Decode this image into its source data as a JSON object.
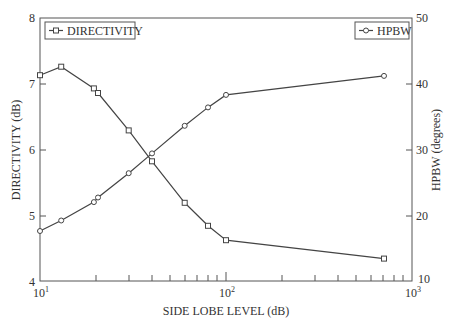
{
  "chart_data": {
    "type": "line",
    "title": "",
    "xlabel": "SIDE LOBE LEVEL (dB)",
    "ylabel": "DIRECTIVITY (dB)",
    "y2label": "HPBW (degrees)",
    "xscale": "log",
    "xlim": [
      10,
      1000
    ],
    "ylim": [
      4,
      8
    ],
    "y2lim": [
      10,
      50
    ],
    "xticks": [
      "10^1",
      "10^2",
      "10^3"
    ],
    "yticks": [
      "4",
      "5",
      "6",
      "7",
      "8"
    ],
    "y2ticks": [
      "10",
      "20",
      "30",
      "40",
      "50"
    ],
    "grid": false,
    "legend_position": "top-left and top-right",
    "series": [
      {
        "name": "DIRECTIVITY",
        "axis": "left",
        "marker": "square",
        "x": [
          10,
          13,
          19.5,
          20.5,
          30,
          40,
          60,
          80,
          100,
          707
        ],
        "values": [
          7.13,
          7.26,
          6.93,
          6.86,
          6.29,
          5.82,
          5.19,
          4.84,
          4.62,
          4.34
        ]
      },
      {
        "name": "HPBW",
        "axis": "right",
        "marker": "circle",
        "x": [
          10,
          13,
          19.5,
          20.5,
          30,
          40,
          60,
          80,
          100,
          707
        ],
        "values": [
          17.6,
          19.2,
          22.0,
          22.7,
          26.4,
          29.4,
          33.6,
          36.4,
          38.3,
          41.2
        ]
      }
    ]
  },
  "labels": {
    "xlabel": "SIDE LOBE LEVEL (dB)",
    "ylabel": "DIRECTIVITY (dB)",
    "y2label": "HPBW (degrees)",
    "legend_left": "DIRECTIVITY",
    "legend_right": "HPBW",
    "ytick_8": "8",
    "ytick_7": "7",
    "ytick_6": "6",
    "ytick_5": "5",
    "ytick_4": "4",
    "y2tick_50": "50",
    "y2tick_40": "40",
    "y2tick_30": "30",
    "y2tick_20": "20",
    "y2tick_10": "10",
    "xtick_base": "10",
    "xtick_exp_1": "1",
    "xtick_exp_2": "2",
    "xtick_exp_3": "3"
  }
}
